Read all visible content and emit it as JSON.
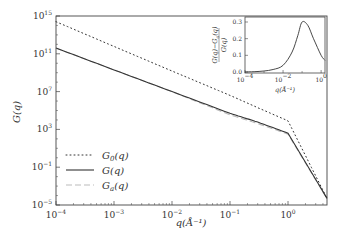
{
  "chart_data": [
    {
      "type": "line",
      "title": "",
      "xlabel": "q(Å⁻¹)",
      "ylabel": "G(q)",
      "xscale": "log",
      "yscale": "log",
      "xlim": [
        0.0001,
        4.7
      ],
      "ylim": [
        1e-05,
        1000000000000000.0
      ],
      "xticks": [
        "10^-4",
        "10^-3",
        "10^-2",
        "10^-1",
        "10^0"
      ],
      "yticks": [
        "10^-5",
        "10^-1",
        "10^3",
        "10^7",
        "10^11",
        "10^15"
      ],
      "grid": false,
      "legend_position": "lower left",
      "series": [
        {
          "name": "G0(q)",
          "label_base": "G",
          "label_sub": "0",
          "style": "dotted",
          "x": [
            0.0001,
            0.001,
            0.01,
            0.1,
            0.3,
            1,
            4.7
          ],
          "y": [
            250000000000000.0,
            600000000000.0,
            1500000000.0,
            4000000.0,
            200000.0,
            8000.0,
            5e-05
          ]
        },
        {
          "name": "G(q)",
          "label_base": "G",
          "label_sub": "",
          "style": "solid",
          "x": [
            0.0001,
            0.001,
            0.01,
            0.1,
            0.3,
            1,
            4.7
          ],
          "y": [
            400000000000.0,
            2000000000.0,
            10000000.0,
            50000.0,
            6000.0,
            400.0,
            5e-05
          ]
        },
        {
          "name": "Ga(q)",
          "label_base": "G",
          "label_sub": "a",
          "style": "dashed",
          "x": [
            0.0001,
            0.001,
            0.01,
            0.1,
            0.3,
            1,
            4.7
          ],
          "y": [
            400000000000.0,
            2000000000.0,
            10000000.0,
            35000.0,
            4200.0,
            320.0,
            5e-05
          ]
        }
      ]
    },
    {
      "type": "line",
      "title": "",
      "role": "inset",
      "xlabel": "q(Å⁻¹)",
      "ylabel": "(G(q) − Ga(q)) / G(q)",
      "xscale": "log",
      "xlim": [
        0.0001,
        1.6
      ],
      "ylim": [
        0.0,
        0.33
      ],
      "xticks": [
        "10^-4",
        "10^-2",
        "10^0"
      ],
      "yticks": [
        "0.0",
        "0.1",
        "0.2",
        "0.3"
      ],
      "series": [
        {
          "name": "(G−Ga)/G",
          "x": [
            0.0001,
            0.0003,
            0.001,
            0.003,
            0.01,
            0.03,
            0.06,
            0.1,
            0.2,
            0.4,
            1,
            1.6
          ],
          "y": [
            0.0,
            0.002,
            0.006,
            0.015,
            0.04,
            0.12,
            0.22,
            0.3,
            0.28,
            0.2,
            0.1,
            0.07
          ]
        }
      ]
    }
  ],
  "labels": {
    "xlabel": "q(Å⁻¹)",
    "ylabel": "G(q)",
    "inset_xlabel": "q(Å⁻¹)"
  }
}
